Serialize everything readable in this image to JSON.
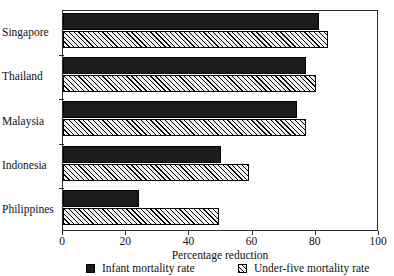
{
  "chart_data": {
    "type": "bar",
    "orientation": "horizontal",
    "title": "",
    "xlabel": "Percentage reduction",
    "ylabel": "",
    "xlim": [
      0,
      100
    ],
    "xticks": [
      0,
      20,
      40,
      60,
      80,
      100
    ],
    "grid": false,
    "legend_position": "bottom",
    "categories": [
      "Singapore",
      "Thailand",
      "Malaysia",
      "Indonesia",
      "Philippines"
    ],
    "series": [
      {
        "name": "Infant mortality rate",
        "style": "solid-black",
        "color": "#1c1c1c",
        "values": [
          81,
          77,
          74,
          50,
          24
        ]
      },
      {
        "name": "Under-five mortality rate",
        "style": "diagonal-hatch",
        "color": "#f2f2f2",
        "values": [
          84,
          80,
          77,
          59,
          49.5
        ]
      }
    ]
  },
  "axis": {
    "x_title": "Percentage reduction",
    "tick_labels": [
      "0",
      "20",
      "40",
      "60",
      "80",
      "100"
    ]
  },
  "legend": {
    "items": [
      {
        "label": "Infant mortality rate",
        "icon": "solid-square-swatch"
      },
      {
        "label": "Under-five mortality rate",
        "icon": "hatched-square-swatch"
      }
    ]
  },
  "title_sliver": {
    "text": ""
  }
}
